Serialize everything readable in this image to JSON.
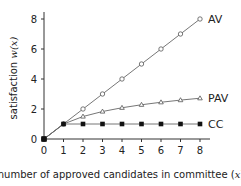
{
  "chart_data": {
    "type": "line",
    "title": "",
    "xlabel": "number of approved candidates in committee (x)",
    "ylabel": "satisfaction w(x)",
    "x": [
      0,
      1,
      2,
      3,
      4,
      5,
      6,
      7,
      8
    ],
    "xlim": [
      0,
      8
    ],
    "ylim": [
      0,
      8
    ],
    "xticks": [
      "0",
      "1",
      "2",
      "3",
      "4",
      "5",
      "6",
      "7",
      "8"
    ],
    "yticks": [
      "0",
      "2",
      "4",
      "6",
      "8"
    ],
    "grid": false,
    "legend_position": "inline right end of lines",
    "series": [
      {
        "name": "AV",
        "marker": "open-circle",
        "values": [
          0,
          1,
          2,
          3,
          4,
          5,
          6,
          7,
          8
        ]
      },
      {
        "name": "PAV",
        "marker": "open-triangle",
        "values": [
          0,
          1,
          1.5,
          1.833,
          2.083,
          2.283,
          2.45,
          2.593,
          2.718
        ]
      },
      {
        "name": "CC",
        "marker": "filled-square",
        "values": [
          0,
          1,
          1,
          1,
          1,
          1,
          1,
          1,
          1
        ]
      }
    ]
  },
  "labels": {
    "xlabel_text": "number of approved candidates in committee (",
    "xlabel_var": "x",
    "xlabel_close": ")",
    "ylabel_text": "satisfaction ",
    "ylabel_var": "w(x)"
  }
}
